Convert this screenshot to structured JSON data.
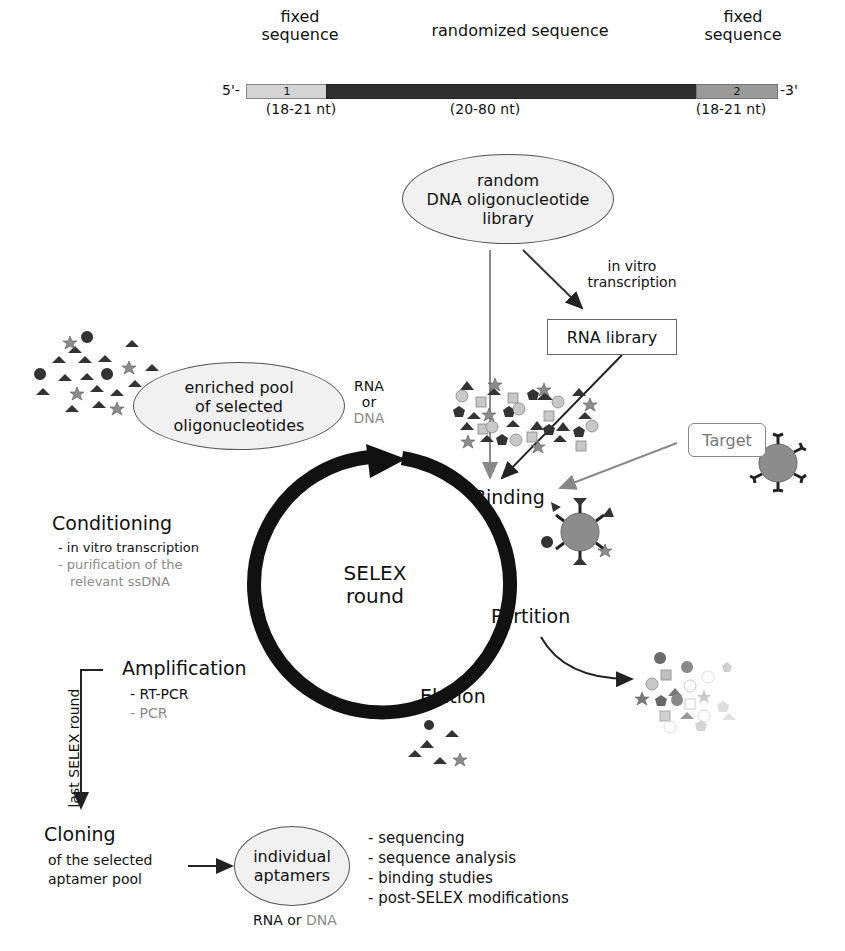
{
  "sequence_bar": {
    "five_prime": "5'-",
    "three_prime": "-3'",
    "segments": [
      {
        "title": "fixed sequence",
        "title_lines": [
          "fixed",
          "sequence"
        ],
        "label": "1",
        "length": "(18-21 nt)",
        "color": "#d4d4d4"
      },
      {
        "title": "randomized sequence",
        "label": "",
        "length": "(20-80 nt)",
        "color": "#2e2e2e"
      },
      {
        "title": "fixed sequence",
        "title_lines": [
          "fixed",
          "sequence"
        ],
        "label": "2",
        "length": "(18-21 nt)",
        "color": "#9a9a9a"
      }
    ]
  },
  "library": {
    "lines": [
      "random",
      "DNA oligonucleotide",
      "library"
    ],
    "transcription_label": [
      "in vitro",
      "transcription"
    ],
    "rna_library": "RNA library"
  },
  "enriched_pool": {
    "lines": [
      "enriched pool",
      "of selected",
      "oligonucleotides"
    ],
    "rna": "RNA",
    "or": "or",
    "dna": "DNA"
  },
  "cycle": {
    "center": [
      "SELEX",
      "round"
    ],
    "steps": {
      "binding": "Binding",
      "partition": "Partition",
      "elution": "Elution",
      "amplification": "Amplification",
      "conditioning": "Conditioning"
    },
    "target_label": "Target",
    "conditioning_items": [
      {
        "text": "- in vitro transcription",
        "tone": "dark"
      },
      {
        "text": "- purification of the",
        "tone": "grey"
      },
      {
        "text": "relevant ssDNA",
        "tone": "grey"
      }
    ],
    "amplification_items": [
      {
        "text": "- RT-PCR",
        "tone": "dark"
      },
      {
        "text": "- PCR",
        "tone": "grey"
      }
    ]
  },
  "final": {
    "last_round_label": "last SELEX round",
    "cloning_title": "Cloning",
    "cloning_sub": [
      "of the selected",
      "aptamer pool"
    ],
    "aptamers": [
      "individual",
      "aptamers"
    ],
    "rna_or": "RNA or",
    "dna": "DNA",
    "downstream": [
      "- sequencing",
      "- sequence analysis",
      "- binding studies",
      "- post-SELEX modifications"
    ]
  },
  "colors": {
    "dark_shape": "#333333",
    "grey_shape": "#8c8c8c",
    "light_shape": "#c8c8c8",
    "grey_text": "#8a8a8a",
    "ellipse_fill": "#f1f1f1"
  }
}
